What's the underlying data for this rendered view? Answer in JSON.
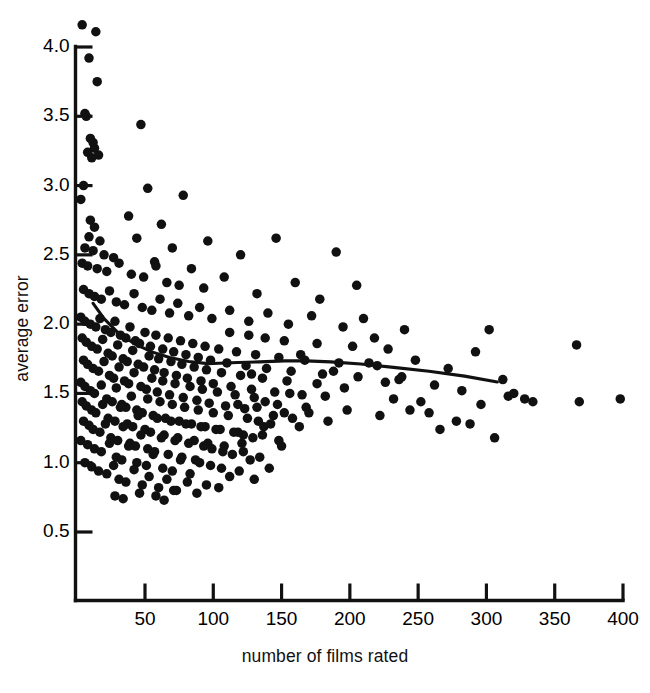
{
  "figure": {
    "title_fragment": "",
    "background": "#ffffff",
    "point_color": "#111111",
    "line_color": "#111111"
  },
  "chart_data": {
    "type": "scatter",
    "title": "",
    "xlabel": "number of films rated",
    "ylabel": "average error",
    "xlim": [
      0,
      410
    ],
    "ylim": [
      0.42,
      4.28
    ],
    "xticks": [
      50,
      100,
      150,
      200,
      250,
      300,
      350,
      400
    ],
    "xticklabels": [
      "50",
      "100",
      "150",
      "200",
      "250",
      "300",
      "350",
      "400"
    ],
    "yticks": [
      0.5,
      1.0,
      1.5,
      2.0,
      2.5,
      3.0,
      3.5,
      4.0
    ],
    "yticklabels": [
      "0.5",
      "1.0",
      "1.5",
      "2.0",
      "2.5",
      "3.0",
      "3.5",
      "4.0"
    ],
    "grid": false,
    "legend": null,
    "marker": "filled-circle",
    "marker_size_px": 9.5,
    "n_points": 402,
    "points": [
      [
        4,
        4.16
      ],
      [
        14,
        4.11
      ],
      [
        9,
        3.92
      ],
      [
        15,
        3.75
      ],
      [
        6,
        3.52
      ],
      [
        7,
        3.5
      ],
      [
        10,
        3.34
      ],
      [
        12,
        3.31
      ],
      [
        13,
        3.27
      ],
      [
        8,
        3.24
      ],
      [
        16,
        3.22
      ],
      [
        11,
        3.2
      ],
      [
        47,
        3.44
      ],
      [
        5,
        3.0
      ],
      [
        3,
        2.9
      ],
      [
        52,
        2.98
      ],
      [
        78,
        2.93
      ],
      [
        10,
        2.75
      ],
      [
        13,
        2.7
      ],
      [
        9,
        2.63
      ],
      [
        17,
        2.6
      ],
      [
        38,
        2.78
      ],
      [
        62,
        2.72
      ],
      [
        6,
        2.55
      ],
      [
        12,
        2.53
      ],
      [
        20,
        2.5
      ],
      [
        27,
        2.48
      ],
      [
        44,
        2.62
      ],
      [
        57,
        2.45
      ],
      [
        70,
        2.55
      ],
      [
        96,
        2.6
      ],
      [
        120,
        2.5
      ],
      [
        146,
        2.62
      ],
      [
        190,
        2.52
      ],
      [
        4,
        2.44
      ],
      [
        8,
        2.42
      ],
      [
        15,
        2.4
      ],
      [
        22,
        2.38
      ],
      [
        31,
        2.44
      ],
      [
        40,
        2.36
      ],
      [
        49,
        2.34
      ],
      [
        58,
        2.42
      ],
      [
        66,
        2.3
      ],
      [
        75,
        2.28
      ],
      [
        84,
        2.4
      ],
      [
        93,
        2.26
      ],
      [
        108,
        2.34
      ],
      [
        132,
        2.22
      ],
      [
        160,
        2.3
      ],
      [
        178,
        2.18
      ],
      [
        205,
        2.28
      ],
      [
        5,
        2.25
      ],
      [
        9,
        2.22
      ],
      [
        13,
        2.2
      ],
      [
        18,
        2.18
      ],
      [
        24,
        2.24
      ],
      [
        29,
        2.16
      ],
      [
        35,
        2.14
      ],
      [
        42,
        2.22
      ],
      [
        48,
        2.12
      ],
      [
        55,
        2.1
      ],
      [
        61,
        2.18
      ],
      [
        68,
        2.08
      ],
      [
        74,
        2.15
      ],
      [
        82,
        2.06
      ],
      [
        90,
        2.12
      ],
      [
        99,
        2.04
      ],
      [
        112,
        2.1
      ],
      [
        126,
        2.02
      ],
      [
        140,
        2.08
      ],
      [
        155,
        2.0
      ],
      [
        172,
        2.06
      ],
      [
        195,
        1.98
      ],
      [
        3,
        2.05
      ],
      [
        6,
        2.02
      ],
      [
        10,
        2.0
      ],
      [
        14,
        1.98
      ],
      [
        17,
        2.04
      ],
      [
        21,
        1.96
      ],
      [
        25,
        1.94
      ],
      [
        28,
        2.02
      ],
      [
        32,
        1.92
      ],
      [
        36,
        1.9
      ],
      [
        39,
        1.98
      ],
      [
        43,
        1.88
      ],
      [
        46,
        1.86
      ],
      [
        50,
        1.94
      ],
      [
        54,
        1.84
      ],
      [
        58,
        1.92
      ],
      [
        63,
        1.82
      ],
      [
        67,
        1.9
      ],
      [
        71,
        1.8
      ],
      [
        76,
        1.88
      ],
      [
        80,
        1.78
      ],
      [
        85,
        1.86
      ],
      [
        89,
        1.76
      ],
      [
        94,
        1.84
      ],
      [
        98,
        1.74
      ],
      [
        104,
        1.82
      ],
      [
        110,
        1.72
      ],
      [
        117,
        1.8
      ],
      [
        124,
        1.7
      ],
      [
        131,
        1.78
      ],
      [
        139,
        1.68
      ],
      [
        148,
        1.76
      ],
      [
        157,
        1.66
      ],
      [
        167,
        1.74
      ],
      [
        180,
        1.64
      ],
      [
        192,
        1.72
      ],
      [
        206,
        1.62
      ],
      [
        220,
        1.7
      ],
      [
        236,
        1.6
      ],
      [
        4,
        1.9
      ],
      [
        7,
        1.87
      ],
      [
        11,
        1.84
      ],
      [
        15,
        1.82
      ],
      [
        19,
        1.89
      ],
      [
        23,
        1.79
      ],
      [
        26,
        1.77
      ],
      [
        30,
        1.85
      ],
      [
        34,
        1.75
      ],
      [
        37,
        1.73
      ],
      [
        41,
        1.81
      ],
      [
        45,
        1.71
      ],
      [
        49,
        1.69
      ],
      [
        53,
        1.77
      ],
      [
        57,
        1.67
      ],
      [
        60,
        1.75
      ],
      [
        64,
        1.65
      ],
      [
        69,
        1.73
      ],
      [
        73,
        1.63
      ],
      [
        77,
        1.71
      ],
      [
        81,
        1.61
      ],
      [
        86,
        1.69
      ],
      [
        91,
        1.59
      ],
      [
        95,
        1.67
      ],
      [
        100,
        1.57
      ],
      [
        106,
        1.65
      ],
      [
        113,
        1.55
      ],
      [
        120,
        1.63
      ],
      [
        128,
        1.53
      ],
      [
        136,
        1.61
      ],
      [
        145,
        1.51
      ],
      [
        154,
        1.59
      ],
      [
        165,
        1.49
      ],
      [
        176,
        1.57
      ],
      [
        5,
        1.74
      ],
      [
        8,
        1.71
      ],
      [
        12,
        1.68
      ],
      [
        16,
        1.66
      ],
      [
        20,
        1.73
      ],
      [
        24,
        1.63
      ],
      [
        27,
        1.61
      ],
      [
        31,
        1.69
      ],
      [
        35,
        1.59
      ],
      [
        38,
        1.57
      ],
      [
        42,
        1.65
      ],
      [
        47,
        1.55
      ],
      [
        51,
        1.53
      ],
      [
        55,
        1.61
      ],
      [
        59,
        1.51
      ],
      [
        63,
        1.59
      ],
      [
        68,
        1.49
      ],
      [
        72,
        1.57
      ],
      [
        78,
        1.47
      ],
      [
        83,
        1.55
      ],
      [
        88,
        1.45
      ],
      [
        92,
        1.53
      ],
      [
        97,
        1.43
      ],
      [
        103,
        1.51
      ],
      [
        109,
        1.41
      ],
      [
        116,
        1.49
      ],
      [
        123,
        1.39
      ],
      [
        130,
        1.47
      ],
      [
        138,
        1.44
      ],
      [
        147,
        1.42
      ],
      [
        156,
        1.5
      ],
      [
        168,
        1.4
      ],
      [
        182,
        1.48
      ],
      [
        198,
        1.38
      ],
      [
        3,
        1.58
      ],
      [
        6,
        1.55
      ],
      [
        10,
        1.52
      ],
      [
        13,
        1.5
      ],
      [
        18,
        1.56
      ],
      [
        22,
        1.46
      ],
      [
        26,
        1.44
      ],
      [
        29,
        1.54
      ],
      [
        33,
        1.42
      ],
      [
        36,
        1.4
      ],
      [
        40,
        1.48
      ],
      [
        44,
        1.38
      ],
      [
        48,
        1.36
      ],
      [
        52,
        1.46
      ],
      [
        56,
        1.34
      ],
      [
        61,
        1.44
      ],
      [
        65,
        1.32
      ],
      [
        70,
        1.42
      ],
      [
        75,
        1.3
      ],
      [
        79,
        1.4
      ],
      [
        84,
        1.28
      ],
      [
        89,
        1.38
      ],
      [
        94,
        1.26
      ],
      [
        100,
        1.36
      ],
      [
        105,
        1.24
      ],
      [
        111,
        1.34
      ],
      [
        118,
        1.22
      ],
      [
        125,
        1.32
      ],
      [
        133,
        1.3
      ],
      [
        142,
        1.28
      ],
      [
        152,
        1.36
      ],
      [
        163,
        1.26
      ],
      [
        4,
        1.44
      ],
      [
        7,
        1.41
      ],
      [
        11,
        1.38
      ],
      [
        14,
        1.36
      ],
      [
        19,
        1.42
      ],
      [
        23,
        1.32
      ],
      [
        28,
        1.3
      ],
      [
        32,
        1.4
      ],
      [
        37,
        1.28
      ],
      [
        41,
        1.26
      ],
      [
        45,
        1.34
      ],
      [
        50,
        1.24
      ],
      [
        54,
        1.22
      ],
      [
        59,
        1.32
      ],
      [
        64,
        1.2
      ],
      [
        69,
        1.3
      ],
      [
        74,
        1.18
      ],
      [
        80,
        1.28
      ],
      [
        86,
        1.16
      ],
      [
        91,
        1.26
      ],
      [
        96,
        1.14
      ],
      [
        102,
        1.24
      ],
      [
        108,
        1.12
      ],
      [
        115,
        1.22
      ],
      [
        122,
        1.2
      ],
      [
        129,
        1.18
      ],
      [
        137,
        1.26
      ],
      [
        148,
        1.16
      ],
      [
        5,
        1.3
      ],
      [
        9,
        1.27
      ],
      [
        12,
        1.24
      ],
      [
        17,
        1.22
      ],
      [
        21,
        1.28
      ],
      [
        25,
        1.18
      ],
      [
        30,
        1.16
      ],
      [
        34,
        1.26
      ],
      [
        39,
        1.14
      ],
      [
        43,
        1.12
      ],
      [
        47,
        1.2
      ],
      [
        52,
        1.1
      ],
      [
        57,
        1.08
      ],
      [
        62,
        1.18
      ],
      [
        67,
        1.06
      ],
      [
        72,
        1.16
      ],
      [
        77,
        1.04
      ],
      [
        82,
        1.14
      ],
      [
        87,
        1.02
      ],
      [
        93,
        1.12
      ],
      [
        99,
        1.1
      ],
      [
        107,
        1.08
      ],
      [
        114,
        1.06
      ],
      [
        121,
        1.14
      ],
      [
        134,
        1.04
      ],
      [
        150,
        1.12
      ],
      [
        3,
        1.16
      ],
      [
        8,
        1.13
      ],
      [
        13,
        1.1
      ],
      [
        18,
        1.08
      ],
      [
        24,
        1.14
      ],
      [
        29,
        1.04
      ],
      [
        33,
        1.02
      ],
      [
        38,
        1.12
      ],
      [
        44,
        1.0
      ],
      [
        51,
        0.98
      ],
      [
        56,
        1.06
      ],
      [
        63,
        0.96
      ],
      [
        70,
        0.94
      ],
      [
        76,
        1.02
      ],
      [
        83,
        0.92
      ],
      [
        90,
        1.0
      ],
      [
        98,
        0.98
      ],
      [
        106,
        0.96
      ],
      [
        119,
        0.94
      ],
      [
        127,
        1.02
      ],
      [
        141,
        0.96
      ],
      [
        6,
        1.0
      ],
      [
        11,
        0.97
      ],
      [
        16,
        0.94
      ],
      [
        22,
        0.92
      ],
      [
        27,
        0.98
      ],
      [
        31,
        0.88
      ],
      [
        36,
        0.86
      ],
      [
        42,
        0.95
      ],
      [
        48,
        0.84
      ],
      [
        53,
        0.9
      ],
      [
        60,
        0.82
      ],
      [
        66,
        0.88
      ],
      [
        73,
        0.8
      ],
      [
        81,
        0.86
      ],
      [
        88,
        0.78
      ],
      [
        95,
        0.84
      ],
      [
        104,
        0.82
      ],
      [
        28,
        0.76
      ],
      [
        34,
        0.74
      ],
      [
        46,
        0.78
      ],
      [
        58,
        0.76
      ],
      [
        64,
        0.73
      ],
      [
        71,
        0.8
      ],
      [
        112,
        0.9
      ],
      [
        130,
        0.88
      ],
      [
        210,
        2.04
      ],
      [
        218,
        1.9
      ],
      [
        228,
        1.82
      ],
      [
        240,
        1.96
      ],
      [
        248,
        1.74
      ],
      [
        252,
        1.44
      ],
      [
        258,
        1.36
      ],
      [
        262,
        1.56
      ],
      [
        266,
        1.24
      ],
      [
        272,
        1.68
      ],
      [
        278,
        1.3
      ],
      [
        282,
        1.52
      ],
      [
        288,
        1.28
      ],
      [
        292,
        1.8
      ],
      [
        296,
        1.42
      ],
      [
        302,
        1.96
      ],
      [
        306,
        1.18
      ],
      [
        312,
        1.6
      ],
      [
        316,
        1.48
      ],
      [
        320,
        1.5
      ],
      [
        328,
        1.46
      ],
      [
        334,
        1.44
      ],
      [
        366,
        1.85
      ],
      [
        368,
        1.44
      ],
      [
        398,
        1.46
      ],
      [
        238,
        1.62
      ],
      [
        244,
        1.38
      ],
      [
        232,
        1.46
      ],
      [
        226,
        1.58
      ],
      [
        222,
        1.34
      ],
      [
        214,
        1.72
      ],
      [
        202,
        1.84
      ],
      [
        196,
        1.54
      ],
      [
        188,
        1.66
      ],
      [
        184,
        1.3
      ],
      [
        176,
        1.86
      ],
      [
        170,
        1.36
      ],
      [
        164,
        1.78
      ],
      [
        158,
        1.32
      ],
      [
        152,
        1.88
      ],
      [
        144,
        1.34
      ],
      [
        138,
        1.9
      ],
      [
        132,
        1.4
      ],
      [
        126,
        1.92
      ],
      [
        118,
        1.42
      ],
      [
        112,
        1.94
      ],
      [
        128,
        1.64
      ],
      [
        136,
        1.2
      ],
      [
        122,
        1.08
      ]
    ],
    "smooth_line": {
      "label": "lowess-smoother",
      "x": [
        12,
        20,
        30,
        42,
        55,
        68,
        82,
        96,
        104,
        118,
        134,
        152,
        168,
        186,
        208,
        232,
        258,
        284,
        308
      ],
      "y": [
        2.15,
        2.04,
        1.94,
        1.86,
        1.8,
        1.76,
        1.73,
        1.715,
        1.718,
        1.723,
        1.728,
        1.735,
        1.735,
        1.728,
        1.712,
        1.688,
        1.66,
        1.625,
        1.583
      ]
    }
  }
}
